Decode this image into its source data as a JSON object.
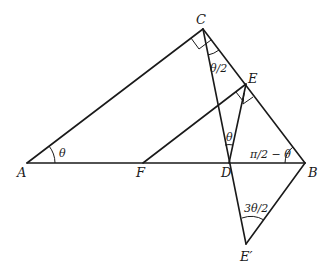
{
  "diagram": {
    "type": "geometry",
    "points": {
      "A": {
        "label": "A",
        "x": 27,
        "y": 163
      },
      "F": {
        "label": "F",
        "x": 143,
        "y": 163
      },
      "D": {
        "label": "D",
        "x": 229,
        "y": 163
      },
      "B": {
        "label": "B",
        "x": 305,
        "y": 163
      },
      "C": {
        "label": "C",
        "x": 203,
        "y": 29
      },
      "E": {
        "label": "E",
        "x": 246,
        "y": 84
      },
      "E_prime": {
        "label": "E′",
        "x": 246,
        "y": 244
      }
    },
    "segments": [
      "AB",
      "AC",
      "CB",
      "CE′",
      "FE",
      "DE",
      "BE′"
    ],
    "angle_labels": {
      "A": "θ",
      "C_half": "θ/2",
      "D": "θ",
      "B": "π/2 − θ",
      "E_prime": "3θ/2"
    },
    "right_angles": [
      "ACB",
      "FED",
      "DEB"
    ]
  }
}
